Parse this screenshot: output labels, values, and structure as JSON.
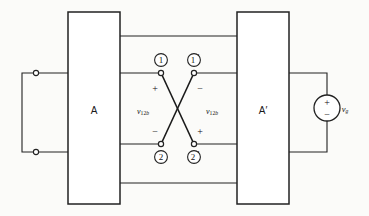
{
  "figure": {
    "background": "#fbfbf9",
    "line_color": "#222222",
    "text_color": "#111111"
  },
  "blocks": [
    {
      "name": "block-a",
      "label": "A",
      "x": 68,
      "y": 12,
      "w": 52,
      "h": 192
    },
    {
      "name": "block-a-prime",
      "label": "A′",
      "x": 237,
      "y": 12,
      "w": 52,
      "h": 192
    }
  ],
  "terminals": [
    {
      "name": "terminal-1",
      "label": "1",
      "prime": false,
      "cx": 161,
      "cy": 73,
      "num_x": 158,
      "num_y": 62
    },
    {
      "name": "terminal-1p",
      "label": "1",
      "prime": true,
      "cx": 194,
      "cy": 73,
      "num_x": 191,
      "num_y": 62
    },
    {
      "name": "terminal-2",
      "label": "2",
      "prime": false,
      "cx": 161,
      "cy": 144,
      "num_x": 158,
      "num_y": 160
    },
    {
      "name": "terminal-2p",
      "label": "2",
      "prime": true,
      "cx": 194,
      "cy": 144,
      "num_x": 191,
      "num_y": 160
    }
  ],
  "polarity_marks": [
    {
      "name": "polarity-plus-top-left",
      "symbol": "+",
      "x": 155,
      "y": 88
    },
    {
      "name": "polarity-minus-top-right",
      "symbol": "−",
      "x": 196,
      "y": 88
    },
    {
      "name": "polarity-minus-bot-left",
      "symbol": "−",
      "x": 155,
      "y": 133
    },
    {
      "name": "polarity-plus-bot-right",
      "symbol": "+",
      "x": 196,
      "y": 133
    }
  ],
  "voltage_labels": [
    {
      "name": "voltage-label-left",
      "symbol": "v",
      "subscript_num": "12",
      "subscript_italic": "b",
      "x": 143,
      "y": 111
    },
    {
      "name": "voltage-label-right",
      "symbol": "v",
      "subscript_num": "12",
      "subscript_italic": "b",
      "x": 180,
      "y": 111
    }
  ],
  "source": {
    "name": "voltage-source",
    "label": "v",
    "label_subscript": "g",
    "cx": 327,
    "cy": 108,
    "r": 13,
    "plus": "+",
    "minus": "−",
    "label_x": 345,
    "label_y": 111
  },
  "left_port": {
    "name": "left-port-loop",
    "terminal_top_y": 73,
    "terminal_bottom_y": 152,
    "x": 22
  },
  "wires": {
    "top_rail_y": 36,
    "bottom_rail_y": 183,
    "upper_pair_y": 73,
    "lower_pair_y": 144
  }
}
